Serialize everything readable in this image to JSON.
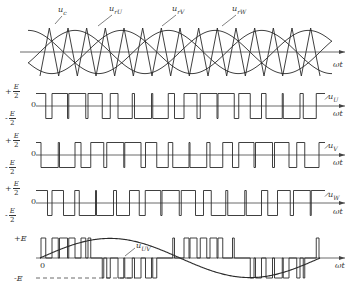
{
  "figure": {
    "axis_label": "ωt",
    "top_plot": {
      "labels": {
        "carrier": "u_c",
        "ref_u": "u_rU",
        "ref_v": "u_rV",
        "ref_w": "u_rW"
      },
      "label_display": {
        "carrier": "u",
        "carrier_sub": "c",
        "ref_u": "u",
        "ref_u_sub": "rU",
        "ref_v": "u",
        "ref_v_sub": "rV",
        "ref_w": "u",
        "ref_w_sub": "rW"
      },
      "carrier_periods": 15,
      "sine_periods": 2
    },
    "phase_plots": [
      {
        "id": "u_U",
        "name": "u",
        "sub": "U",
        "pos_level_sign": "+",
        "neg_level_sign": "-",
        "level_num": "E",
        "level_den": "2",
        "zero": "0"
      },
      {
        "id": "u_V",
        "name": "u",
        "sub": "V",
        "pos_level_sign": "+",
        "neg_level_sign": "-",
        "level_num": "E",
        "level_den": "2",
        "zero": "0"
      },
      {
        "id": "u_W",
        "name": "u",
        "sub": "W",
        "pos_level_sign": "+",
        "neg_level_sign": "-",
        "level_num": "E",
        "level_den": "2",
        "zero": "0"
      }
    ],
    "line_plot": {
      "id": "u_UV",
      "name": "u",
      "sub": "UV",
      "pos_level": "+E",
      "neg_level": "-E",
      "zero": "0"
    },
    "colors": {
      "line": "#2a2a2a",
      "axis": "#444444",
      "background": "#ffffff"
    }
  }
}
